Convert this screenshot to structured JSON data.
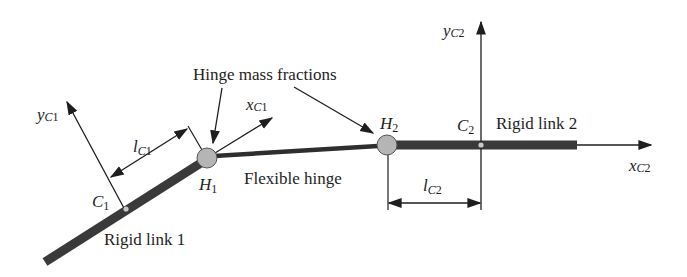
{
  "diagram": {
    "colors": {
      "link": "#3a3a3a",
      "line": "#1e1e1e",
      "hinge_fill": "#b5b5b5",
      "center_dot": "#c8c8c8",
      "background": "#ffffff"
    },
    "labels": {
      "hinge_mass_fractions": "Hinge mass fractions",
      "flexible_hinge": "Flexible hinge",
      "rigid_link_1": "Rigid link 1",
      "rigid_link_2": "Rigid link 2"
    },
    "symbols": {
      "y_c1": {
        "base": "y",
        "sub_c": "C",
        "sub_n": "1"
      },
      "x_c1": {
        "base": "x",
        "sub_c": "C",
        "sub_n": "1"
      },
      "l_c1": {
        "base": "l",
        "sub_c": "C",
        "sub_n": "1"
      },
      "c1": {
        "base": "C",
        "sub_n": "1"
      },
      "h1": {
        "base": "H",
        "sub_n": "1"
      },
      "h2": {
        "base": "H",
        "sub_n": "2"
      },
      "c2": {
        "base": "C",
        "sub_n": "2"
      },
      "y_c2": {
        "base": "y",
        "sub_c": "C",
        "sub_n": "2"
      },
      "x_c2": {
        "base": "x",
        "sub_c": "C",
        "sub_n": "2"
      },
      "l_c2": {
        "base": "l",
        "sub_c": "C",
        "sub_n": "2"
      }
    },
    "nodes": [
      {
        "id": "H1",
        "type": "hinge-mass",
        "label": "H1"
      },
      {
        "id": "H2",
        "type": "hinge-mass",
        "label": "H2"
      },
      {
        "id": "C1",
        "type": "center-of-mass",
        "label": "C1"
      },
      {
        "id": "C2",
        "type": "center-of-mass",
        "label": "C2"
      }
    ],
    "edges": [
      {
        "from": "start",
        "to": "H1",
        "label": "Rigid link 1",
        "type": "rigid"
      },
      {
        "from": "H1",
        "to": "H2",
        "label": "Flexible hinge",
        "type": "flexible"
      },
      {
        "from": "H2",
        "to": "end",
        "label": "Rigid link 2",
        "type": "rigid"
      }
    ]
  }
}
